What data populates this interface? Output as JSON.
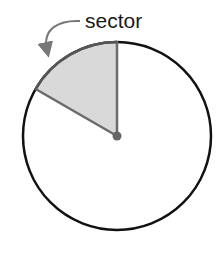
{
  "diagram": {
    "label": "sector",
    "circle": {
      "cx": 117,
      "cy": 136,
      "r": 94,
      "stroke": "#111111"
    },
    "sector": {
      "fill": "#d9d9d9",
      "stroke": "#6b6b6b",
      "from_angle_deg": 90,
      "to_angle_deg": 150
    },
    "center_dot_color": "#666666",
    "arrow_color": "#777777"
  }
}
